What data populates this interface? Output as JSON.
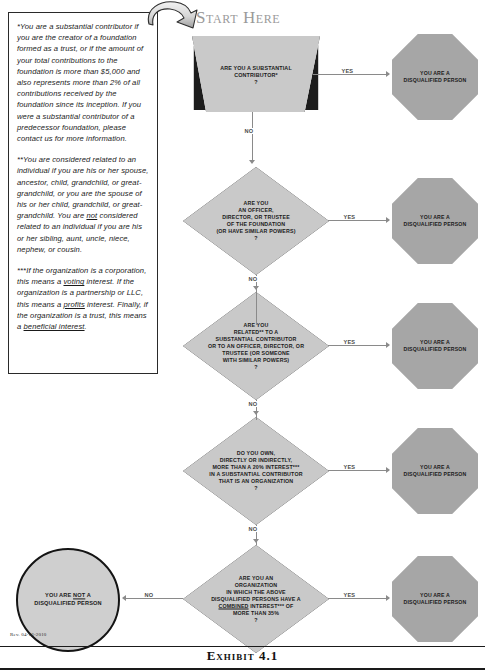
{
  "document": {
    "exhibit_caption": "Exhibit 4.1",
    "revision": "Rev. 04-16-2010",
    "start_label": "Start Here"
  },
  "notes": {
    "note1_parts": {
      "a": "*You are a substantial contributor if you are the creator of a foundation formed as a trust, or if the amount of your total contributions to the foundation is more than $5,000 and also represents more than 2% of all contributions received by the foundation since its inception. If you were a substantial contributor of a predecessor foundation, please contact us for more information."
    },
    "note2_parts": {
      "a": "**You are considered related to an individual if you are his or her spouse, ancestor, child, grandchild, or great-grandchild, or you are the spouse of his or her child, grandchild, or great-grandchild. You are ",
      "b": "not",
      "c": " considered related to an individual if you are his or her sibling, aunt, uncle, niece, nephew, or cousin."
    },
    "note3_parts": {
      "a": "***If the organization is a corporation, this means a ",
      "b": "voting",
      "c": " interest. If the organization is a partnership or LLC, this means a ",
      "d": "profits",
      "e": " interest. Finally, if the organization is a trust, this means a ",
      "f": "beneficial interest",
      "g": "."
    }
  },
  "flow": {
    "questions": [
      {
        "id": "q1",
        "shape": "trapezoid",
        "text": "ARE YOU A SUBSTANTIAL\nCONTRIBUTOR*\n?"
      },
      {
        "id": "q2",
        "shape": "diamond",
        "text": "ARE YOU\nAN OFFICER,\nDIRECTOR, OR TRUSTEE\nOF THE FOUNDATION\n(OR HAVE SIMILAR POWERS)\n?"
      },
      {
        "id": "q3",
        "shape": "diamond",
        "text": "ARE YOU\nRELATED** TO A\nSUBSTANTIAL CONTRIBUTOR\nOR TO AN OFFICER, DIRECTOR, OR\nTRUSTEE (OR SOMEONE\nWITH SIMILAR POWERS)\n?"
      },
      {
        "id": "q4",
        "shape": "diamond",
        "text": "DO YOU OWN,\nDIRECTLY OR INDIRECTLY,\nMORE THAN A 20% INTEREST***\nIN A SUBSTANTIAL CONTRIBUTOR\nTHAT IS AN ORGANIZATION\n?"
      },
      {
        "id": "q5",
        "shape": "diamond",
        "text_parts": {
          "a": "ARE YOU AN\nORGANIZATION\nIN WHICH THE ABOVE\nDISQUALIFIED PERSONS HAVE A\n",
          "b": "COMBINED",
          "c": " INTEREST*** OF\nMORE THAN 35%\n?"
        }
      }
    ],
    "outcomes_yes": [
      {
        "id": "o1",
        "text": "YOU ARE A\nDISQUALIFIED PERSON"
      },
      {
        "id": "o2",
        "text": "YOU ARE A\nDISQUALIFIED PERSON"
      },
      {
        "id": "o3",
        "text": "YOU ARE A\nDISQUALIFIED PERSON"
      },
      {
        "id": "o4",
        "text": "YOU ARE A\nDISQUALIFIED PERSON"
      },
      {
        "id": "o5",
        "text": "YOU ARE A\nDISQUALIFIED PERSON"
      }
    ],
    "outcome_no": {
      "id": "no-outcome",
      "parts": {
        "a": "YOU ARE ",
        "b": "NOT",
        "c": " A\nDISQUALIFIED PERSON"
      }
    },
    "edge_labels": {
      "yes": "YES",
      "no": "NO"
    }
  },
  "colors": {
    "question_fill": "#c9c9c9",
    "outcome_fill": "#a6a6a6",
    "circle_fill": "#cfcfcf",
    "line": "#8a8a8a",
    "outline": "#1d1d1d",
    "start_label": "#9a9a9a"
  }
}
